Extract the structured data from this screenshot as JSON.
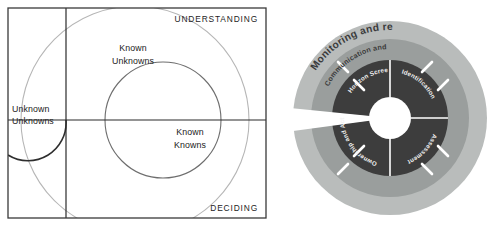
{
  "figures": {
    "quadrant": {
      "name": "knowledge-quadrant-diagram",
      "axis_labels": {
        "vertical_top": "UNDERSTANDING",
        "horizontal_bottom": "DECIDING"
      },
      "cells": [
        {
          "id": "unknown-unknowns",
          "line1": "Unknown",
          "line2": "Unknowns"
        },
        {
          "id": "known-unknowns",
          "line1": "Known",
          "line2": "Unknowns"
        },
        {
          "id": "known-knowns",
          "line1": "Known",
          "line2": "Knowns"
        }
      ],
      "colors": {
        "frame": "#3a3a3a",
        "axis": "#2a2a2a",
        "outer_arc": "#b6b6b6",
        "inner_arc": "#6e6e6e",
        "small_arc": "#2e2e2e",
        "text": "#222222",
        "background": "#ffffff"
      }
    },
    "wheel": {
      "name": "risk-management-wheel-diagram",
      "rings": [
        {
          "id": "outer-ring",
          "label": "Monitoring and review",
          "color": "#b9bcbb"
        },
        {
          "id": "middle-ring",
          "label": "Communication and Consultation",
          "color": "#9a9e9d"
        }
      ],
      "segments": [
        {
          "id": "horizon-screening",
          "label": "Horizon Screening",
          "position": "top-left"
        },
        {
          "id": "identification",
          "label": "Identification",
          "position": "top-right"
        },
        {
          "id": "assessment",
          "label": "Assessment",
          "position": "bottom-right"
        },
        {
          "id": "ownership-and-action",
          "label": "Ownership and Action",
          "position": "bottom-left"
        }
      ],
      "colors": {
        "inner_ring": "#3d3d3d",
        "middle_ring": "#9a9e9d",
        "outer_ring": "#b9bcbb",
        "hub": "#ffffff",
        "divider": "#ffffff",
        "arrow": "#ffffff",
        "background": "#ffffff"
      }
    }
  }
}
